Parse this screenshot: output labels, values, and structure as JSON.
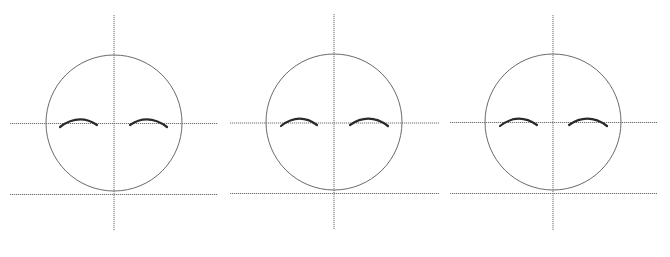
{
  "diagram": {
    "colors": {
      "background": "#ffffff",
      "guide_line": "#6e6e6e",
      "head_outline": "#6a6a6a",
      "eyebrow": "#2a2a2a"
    },
    "panels": [
      {
        "id": "panel-1",
        "head": {
          "cx": 114,
          "cy": 123,
          "r": 68
        },
        "vertical_guide": {
          "x": 114,
          "y1": 15,
          "y2": 231
        },
        "brow_guide": {
          "y": 123.5,
          "x1": 10,
          "x2": 218
        },
        "chin_guide": {
          "y": 194.5,
          "x1": 10,
          "x2": 218
        },
        "left_brow": "M60 127 Q79 113 97 125",
        "right_brow": "M130 125 Q148 113 167 127"
      },
      {
        "id": "panel-2",
        "head": {
          "cx": 334,
          "cy": 122,
          "r": 68
        },
        "vertical_guide": {
          "x": 334,
          "y1": 14,
          "y2": 229
        },
        "brow_guide": {
          "y": 123,
          "x1": 230,
          "x2": 439
        },
        "chin_guide": {
          "y": 193.5,
          "x1": 230,
          "x2": 439
        },
        "left_brow": "M281 126 Q299 112 317 125",
        "right_brow": "M350 125 Q369 112 388 126"
      },
      {
        "id": "panel-3",
        "head": {
          "cx": 553,
          "cy": 122,
          "r": 68
        },
        "vertical_guide": {
          "x": 553,
          "y1": 15,
          "y2": 230
        },
        "brow_guide": {
          "y": 122.5,
          "x1": 450,
          "x2": 657
        },
        "chin_guide": {
          "y": 193.5,
          "x1": 450,
          "x2": 657
        },
        "left_brow": "M500 126 Q518 112 537 125",
        "right_brow": "M569 125 Q588 112 607 126"
      }
    ]
  }
}
